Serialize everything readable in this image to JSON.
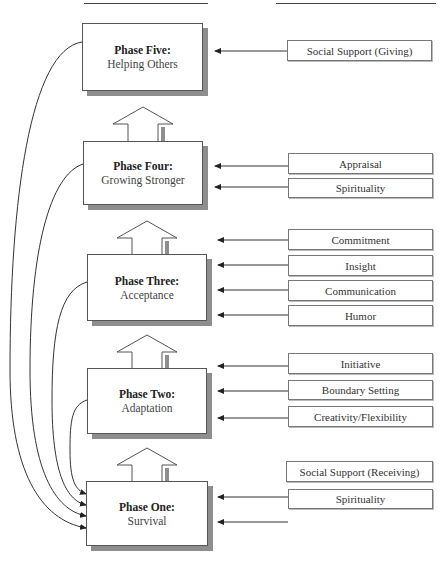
{
  "headers": {
    "left": "",
    "right": ""
  },
  "phases": [
    {
      "id": "five",
      "title": "Phase Five:",
      "subtitle": "Helping Others"
    },
    {
      "id": "four",
      "title": "Phase Four:",
      "subtitle": "Growing Stronger"
    },
    {
      "id": "three",
      "title": "Phase Three:",
      "subtitle": "Acceptance"
    },
    {
      "id": "two",
      "title": "Phase Two:",
      "subtitle": "Adaptation"
    },
    {
      "id": "one",
      "title": "Phase One:",
      "subtitle": "Survival"
    }
  ],
  "factors": {
    "five": [
      "Social Support (Giving)"
    ],
    "four": [
      "Appraisal",
      "Spirituality"
    ],
    "three": [
      "Commitment",
      "Insight",
      "Communication",
      "Humor"
    ],
    "two": [
      "Initiative",
      "Boundary Setting",
      "Creativity/Flexibility"
    ],
    "one": [
      "Social Support (Receiving)",
      "Spirituality"
    ]
  },
  "colors": {
    "line": "#333333",
    "shadow": "#8e8e8e",
    "border": "#555555"
  }
}
